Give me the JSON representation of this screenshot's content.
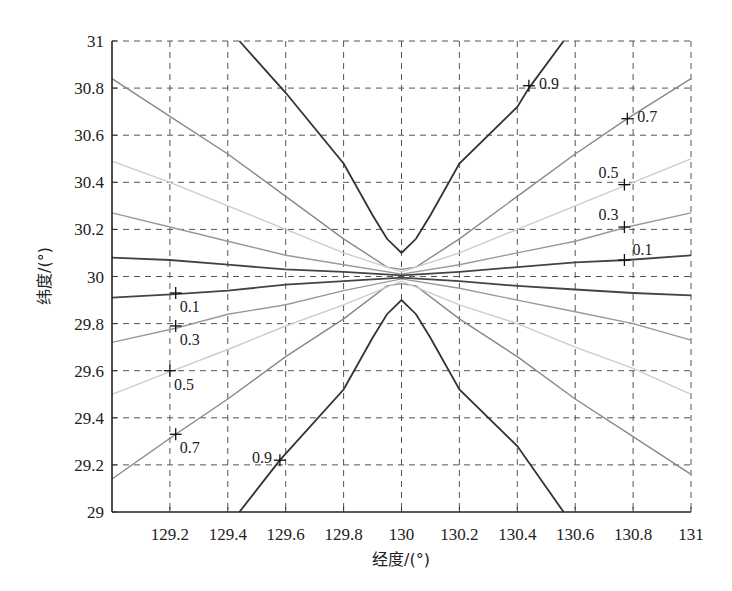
{
  "chart_data": {
    "type": "line",
    "title": "",
    "xlabel": "经度/(°)",
    "ylabel": "纬度/(°)",
    "xlim": [
      129,
      131
    ],
    "ylim": [
      29,
      31
    ],
    "grid": true,
    "grid_style": "dashed",
    "xticks": [
      "129.2",
      "129.4",
      "129.6",
      "129.8",
      "130",
      "130.2",
      "130.4",
      "130.6",
      "130.8",
      "131"
    ],
    "yticks": [
      "29",
      "29.2",
      "29.4",
      "29.6",
      "29.8",
      "30",
      "30.2",
      "30.4",
      "30.6",
      "30.8",
      "31"
    ],
    "series": [
      {
        "name": "0.9",
        "color": "#333333",
        "upper": [
          [
            129.44,
            31.0
          ],
          [
            129.6,
            30.78
          ],
          [
            129.8,
            30.48
          ],
          [
            129.9,
            30.26
          ],
          [
            129.95,
            30.16
          ],
          [
            130.0,
            30.1
          ],
          [
            130.05,
            30.16
          ],
          [
            130.1,
            30.26
          ],
          [
            130.2,
            30.48
          ],
          [
            130.4,
            30.72
          ],
          [
            130.44,
            30.8
          ],
          [
            130.56,
            31.0
          ]
        ],
        "lower": [
          [
            129.44,
            29.0
          ],
          [
            129.58,
            29.22
          ],
          [
            129.8,
            29.52
          ],
          [
            129.9,
            29.74
          ],
          [
            129.95,
            29.84
          ],
          [
            130.0,
            29.9
          ],
          [
            130.05,
            29.84
          ],
          [
            130.1,
            29.74
          ],
          [
            130.2,
            29.52
          ],
          [
            130.4,
            29.28
          ],
          [
            130.56,
            29.0
          ]
        ]
      },
      {
        "name": "0.7",
        "color": "#888888",
        "upper": [
          [
            129.0,
            30.84
          ],
          [
            129.2,
            30.68
          ],
          [
            129.4,
            30.52
          ],
          [
            129.6,
            30.34
          ],
          [
            129.8,
            30.16
          ],
          [
            129.95,
            30.04
          ],
          [
            130.0,
            30.03
          ],
          [
            130.05,
            30.04
          ],
          [
            130.2,
            30.16
          ],
          [
            130.4,
            30.34
          ],
          [
            130.6,
            30.52
          ],
          [
            130.78,
            30.67
          ],
          [
            131.0,
            30.84
          ]
        ],
        "lower": [
          [
            129.0,
            29.14
          ],
          [
            129.22,
            29.33
          ],
          [
            129.4,
            29.48
          ],
          [
            129.6,
            29.66
          ],
          [
            129.8,
            29.82
          ],
          [
            129.95,
            29.96
          ],
          [
            130.0,
            29.97
          ],
          [
            130.05,
            29.96
          ],
          [
            130.2,
            29.82
          ],
          [
            130.4,
            29.66
          ],
          [
            130.6,
            29.48
          ],
          [
            130.8,
            29.32
          ],
          [
            131.0,
            29.16
          ]
        ]
      },
      {
        "name": "0.5",
        "color": "#cccccc",
        "upper": [
          [
            129.0,
            30.49
          ],
          [
            129.2,
            30.4
          ],
          [
            129.4,
            30.3
          ],
          [
            129.6,
            30.2
          ],
          [
            129.8,
            30.1
          ],
          [
            130.0,
            30.02
          ],
          [
            130.2,
            30.1
          ],
          [
            130.4,
            30.2
          ],
          [
            130.6,
            30.3
          ],
          [
            130.78,
            30.39
          ],
          [
            131.0,
            30.5
          ]
        ],
        "lower": [
          [
            129.0,
            29.5
          ],
          [
            129.21,
            29.6
          ],
          [
            129.4,
            29.69
          ],
          [
            129.6,
            29.79
          ],
          [
            129.8,
            29.88
          ],
          [
            130.0,
            29.98
          ],
          [
            130.2,
            29.88
          ],
          [
            130.4,
            29.8
          ],
          [
            130.6,
            29.7
          ],
          [
            130.8,
            29.61
          ],
          [
            131.0,
            29.5
          ]
        ]
      },
      {
        "name": "0.3",
        "color": "#999999",
        "upper": [
          [
            129.0,
            30.27
          ],
          [
            129.2,
            30.21
          ],
          [
            129.4,
            30.15
          ],
          [
            129.6,
            30.09
          ],
          [
            129.8,
            30.05
          ],
          [
            130.0,
            30.01
          ],
          [
            130.2,
            30.05
          ],
          [
            130.4,
            30.1
          ],
          [
            130.6,
            30.15
          ],
          [
            130.78,
            30.21
          ],
          [
            131.0,
            30.27
          ]
        ],
        "lower": [
          [
            129.0,
            29.72
          ],
          [
            129.22,
            29.78
          ],
          [
            129.4,
            29.84
          ],
          [
            129.6,
            29.88
          ],
          [
            129.8,
            29.94
          ],
          [
            130.0,
            29.99
          ],
          [
            130.2,
            29.95
          ],
          [
            130.4,
            29.9
          ],
          [
            130.6,
            29.85
          ],
          [
            130.8,
            29.8
          ],
          [
            131.0,
            29.73
          ]
        ]
      },
      {
        "name": "0.1",
        "color": "#444444",
        "upper": [
          [
            129.0,
            30.08
          ],
          [
            129.2,
            30.07
          ],
          [
            129.4,
            30.05
          ],
          [
            129.6,
            30.03
          ],
          [
            129.8,
            30.02
          ],
          [
            130.0,
            30.005
          ],
          [
            130.2,
            30.02
          ],
          [
            130.4,
            30.04
          ],
          [
            130.6,
            30.06
          ],
          [
            130.78,
            30.07
          ],
          [
            131.0,
            30.09
          ]
        ],
        "lower": [
          [
            129.0,
            29.91
          ],
          [
            129.22,
            29.925
          ],
          [
            129.4,
            29.94
          ],
          [
            129.6,
            29.965
          ],
          [
            129.8,
            29.98
          ],
          [
            130.0,
            29.995
          ],
          [
            130.2,
            29.98
          ],
          [
            130.4,
            29.96
          ],
          [
            130.6,
            29.945
          ],
          [
            130.8,
            29.93
          ],
          [
            131.0,
            29.92
          ]
        ]
      }
    ],
    "markers": [
      {
        "label": "0.9",
        "x": 130.44,
        "y": 30.81,
        "label_side": "right"
      },
      {
        "label": "0.7",
        "x": 130.78,
        "y": 30.67,
        "label_side": "right"
      },
      {
        "label": "0.5",
        "x": 130.77,
        "y": 30.39,
        "label_side": "above-left"
      },
      {
        "label": "0.3",
        "x": 130.77,
        "y": 30.21,
        "label_side": "above-left"
      },
      {
        "label": "0.1",
        "x": 130.77,
        "y": 30.07,
        "label_side": "above-right"
      },
      {
        "label": "0.1",
        "x": 129.22,
        "y": 29.93,
        "label_side": "below-right"
      },
      {
        "label": "0.3",
        "x": 129.22,
        "y": 29.79,
        "label_side": "below-right"
      },
      {
        "label": "0.5",
        "x": 129.2,
        "y": 29.6,
        "label_side": "below-right"
      },
      {
        "label": "0.7",
        "x": 129.22,
        "y": 29.33,
        "label_side": "below-right"
      },
      {
        "label": "0.9",
        "x": 129.58,
        "y": 29.22,
        "label_side": "left"
      }
    ]
  }
}
